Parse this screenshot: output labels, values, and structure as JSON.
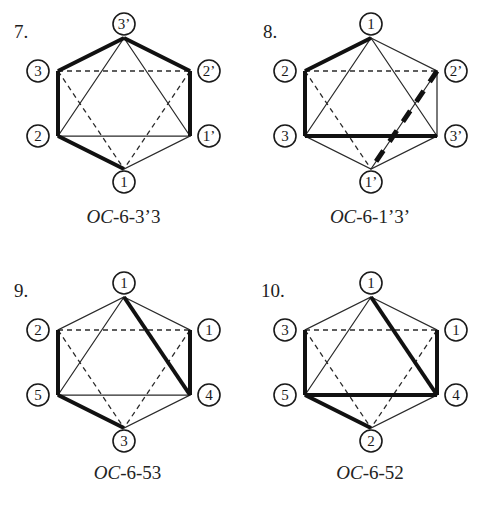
{
  "figure": {
    "kind": "octahedral-stereochemistry-hexagon-diagrams",
    "panel_count": 4
  },
  "panels": [
    {
      "number": "7.",
      "caption_prefix": "OC",
      "caption_rest": "-6-3’3",
      "caption_full": "OC-6-3’3",
      "vertices": [
        {
          "id": "top",
          "label": "3’",
          "x": 124,
          "y": 24,
          "label_x": 124,
          "label_y": 24
        },
        {
          "id": "upper-left",
          "label": "3",
          "x": 38,
          "y": 71,
          "label_x": 38,
          "label_y": 71
        },
        {
          "id": "upper-right",
          "label": "2’",
          "x": 209,
          "y": 71,
          "label_x": 209,
          "label_y": 71
        },
        {
          "id": "lower-left",
          "label": "2",
          "x": 38,
          "y": 136,
          "label_x": 38,
          "label_y": 136
        },
        {
          "id": "lower-right",
          "label": "1’",
          "x": 209,
          "y": 136,
          "label_x": 209,
          "label_y": 136
        },
        {
          "id": "bottom",
          "label": "1",
          "x": 124,
          "y": 182,
          "label_x": 124,
          "label_y": 182
        }
      ],
      "bold_edges": [
        "top-upperleft",
        "top-upperright",
        "upperleft-lowerleft",
        "upperright-lowerright",
        "lowerleft-bottom"
      ],
      "bold_dashed_edges": []
    },
    {
      "number": "8.",
      "caption_prefix": "OC",
      "caption_rest": "-6-1’3’",
      "caption_full": "OC-6-1’3’",
      "vertices": [
        {
          "id": "top",
          "label": "1",
          "x": 124,
          "y": 24,
          "label_x": 124,
          "label_y": 24
        },
        {
          "id": "upper-left",
          "label": "2",
          "x": 38,
          "y": 71,
          "label_x": 38,
          "label_y": 71
        },
        {
          "id": "upper-right",
          "label": "2’",
          "x": 209,
          "y": 71,
          "label_x": 209,
          "label_y": 71
        },
        {
          "id": "lower-left",
          "label": "3",
          "x": 38,
          "y": 136,
          "label_x": 38,
          "label_y": 136
        },
        {
          "id": "lower-right",
          "label": "3’",
          "x": 209,
          "y": 136,
          "label_x": 209,
          "label_y": 136
        },
        {
          "id": "bottom",
          "label": "1’",
          "x": 124,
          "y": 182,
          "label_x": 124,
          "label_y": 182
        }
      ],
      "bold_edges": [
        "top-upperleft",
        "upperleft-lowerleft",
        "lowerleft-lowerright"
      ],
      "bold_dashed_edges": [
        "upperright-bottom"
      ]
    },
    {
      "number": "9.",
      "caption_prefix": "OC",
      "caption_rest": "-6-53",
      "caption_full": "OC-6-53",
      "vertices": [
        {
          "id": "top",
          "label": "1",
          "x": 124,
          "y": 24,
          "label_x": 124,
          "label_y": 24
        },
        {
          "id": "upper-left",
          "label": "2",
          "x": 38,
          "y": 71,
          "label_x": 38,
          "label_y": 71
        },
        {
          "id": "upper-right",
          "label": "1",
          "x": 209,
          "y": 71,
          "label_x": 209,
          "label_y": 71
        },
        {
          "id": "lower-left",
          "label": "5",
          "x": 38,
          "y": 136,
          "label_x": 38,
          "label_y": 136
        },
        {
          "id": "lower-right",
          "label": "4",
          "x": 209,
          "y": 136,
          "label_x": 209,
          "label_y": 136
        },
        {
          "id": "bottom",
          "label": "3",
          "x": 124,
          "y": 182,
          "label_x": 124,
          "label_y": 182
        }
      ],
      "bold_edges": [
        "upperleft-lowerleft",
        "upperright-lowerright",
        "lowerleft-bottom",
        "top-lowerright"
      ],
      "bold_dashed_edges": []
    },
    {
      "number": "10.",
      "caption_prefix": "OC",
      "caption_rest": "-6-52",
      "caption_full": "OC-6-52",
      "vertices": [
        {
          "id": "top",
          "label": "1",
          "x": 124,
          "y": 24,
          "label_x": 124,
          "label_y": 24
        },
        {
          "id": "upper-left",
          "label": "3",
          "x": 38,
          "y": 71,
          "label_x": 38,
          "label_y": 71
        },
        {
          "id": "upper-right",
          "label": "1",
          "x": 209,
          "y": 71,
          "label_x": 209,
          "label_y": 71
        },
        {
          "id": "lower-left",
          "label": "5",
          "x": 38,
          "y": 136,
          "label_x": 38,
          "label_y": 136
        },
        {
          "id": "lower-right",
          "label": "4",
          "x": 209,
          "y": 136,
          "label_x": 209,
          "label_y": 136
        },
        {
          "id": "bottom",
          "label": "2",
          "x": 124,
          "y": 182,
          "label_x": 124,
          "label_y": 182
        }
      ],
      "bold_edges": [
        "upperleft-lowerleft",
        "upperright-lowerright",
        "lowerleft-lowerright",
        "lowerleft-bottom",
        "top-lowerright"
      ],
      "bold_dashed_edges": []
    }
  ],
  "colors": {
    "ink": "#1a1a1a",
    "bold_ink": "#111111",
    "background": "#ffffff"
  }
}
